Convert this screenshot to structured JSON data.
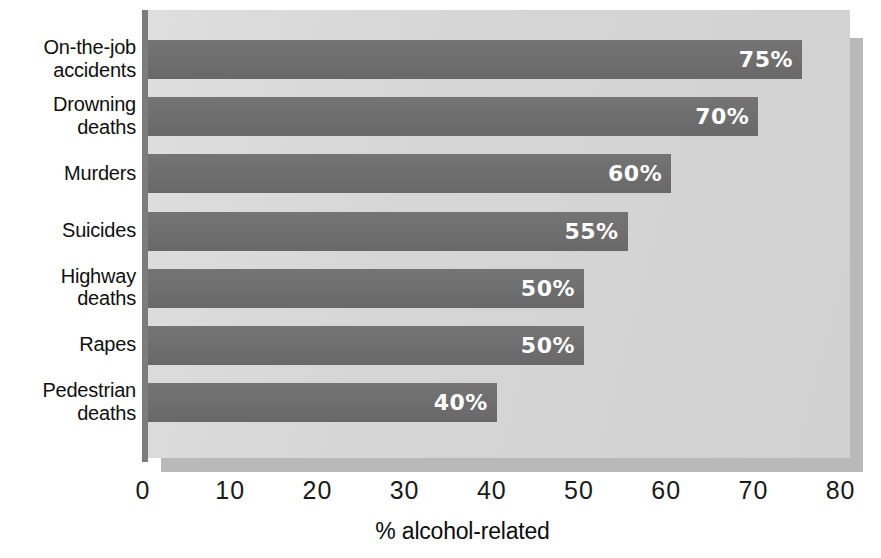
{
  "chart_data": {
    "type": "bar",
    "orientation": "horizontal",
    "title": "",
    "subtitle": "",
    "xlabel": "% alcohol-related",
    "ylabel": "",
    "xlim": [
      0,
      80
    ],
    "ylim": null,
    "grid": false,
    "legend": null,
    "legend_position": "none",
    "xticks": [
      "0",
      "10",
      "20",
      "30",
      "40",
      "50",
      "60",
      "70",
      "80"
    ],
    "xtick_values": [
      0,
      10,
      20,
      30,
      40,
      50,
      60,
      70,
      80
    ],
    "categories": [
      "On-the-job accidents",
      "Drowning deaths",
      "Murders",
      "Suicides",
      "Highway deaths",
      "Rapes",
      "Pedestrian deaths"
    ],
    "values": [
      75,
      70,
      60,
      55,
      50,
      50,
      40
    ],
    "data_labels": [
      "75%",
      "70%",
      "60%",
      "55%",
      "50%",
      "50%",
      "40%"
    ],
    "bars": [
      {
        "category_lines": [
          "On-the-job",
          "accidents"
        ],
        "value": 75,
        "label": "75%"
      },
      {
        "category_lines": [
          "Drowning",
          "deaths"
        ],
        "value": 70,
        "label": "70%"
      },
      {
        "category_lines": [
          "Murders"
        ],
        "value": 60,
        "label": "60%"
      },
      {
        "category_lines": [
          "Suicides"
        ],
        "value": 55,
        "label": "55%"
      },
      {
        "category_lines": [
          "Highway",
          "deaths"
        ],
        "value": 50,
        "label": "50%"
      },
      {
        "category_lines": [
          "Rapes"
        ],
        "value": 50,
        "label": "50%"
      },
      {
        "category_lines": [
          "Pedestrian",
          "deaths"
        ],
        "value": 40,
        "label": "40%"
      }
    ],
    "colors": {
      "bar": "#6e6e6e",
      "plot_background": "#d6d6d6",
      "panel_shadow": "#b9b9b9",
      "axis_line": "#7c7c7c",
      "data_label_text": "#ffffff",
      "category_label_text": "#101010",
      "tick_label_text": "#1a1a1a",
      "page_background": "#ffffff"
    }
  }
}
